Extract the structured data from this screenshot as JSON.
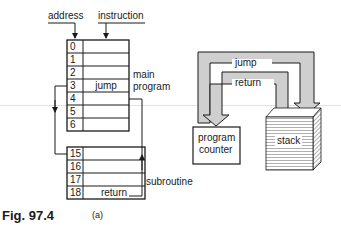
{
  "figure": {
    "caption": "Fig. 97.4",
    "part_label": "(a)"
  },
  "memory": {
    "address_label": "address",
    "instruction_label": "instruction",
    "main_program_label_1": "main",
    "main_program_label_2": "program",
    "subroutine_label": "subroutine",
    "main_rows": [
      {
        "address": "0",
        "instruction": ""
      },
      {
        "address": "1",
        "instruction": ""
      },
      {
        "address": "2",
        "instruction": ""
      },
      {
        "address": "3",
        "instruction": "jump"
      },
      {
        "address": "4",
        "instruction": ""
      },
      {
        "address": "5",
        "instruction": ""
      },
      {
        "address": "6",
        "instruction": ""
      }
    ],
    "sub_rows": [
      {
        "address": "15",
        "instruction": ""
      },
      {
        "address": "16",
        "instruction": ""
      },
      {
        "address": "17",
        "instruction": ""
      },
      {
        "address": "18",
        "instruction": "return"
      }
    ]
  },
  "stack_diagram": {
    "jump_label": "jump",
    "return_label": "return",
    "program_counter_label_1": "program",
    "program_counter_label_2": "counter",
    "stack_label": "stack",
    "arrow_fill": "#cfcfcf"
  }
}
